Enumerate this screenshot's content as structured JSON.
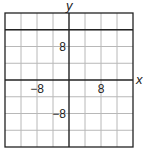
{
  "chart_data": {
    "type": "line",
    "title": "",
    "xlabel": "x",
    "ylabel": "y",
    "xlim": [
      -16,
      16
    ],
    "ylim": [
      -16,
      16
    ],
    "grid": true,
    "grid_step": 4,
    "x_tick_labels": [
      {
        "value": -8,
        "label": "−8"
      },
      {
        "value": 8,
        "label": "8"
      }
    ],
    "y_tick_labels": [
      {
        "value": 8,
        "label": "8"
      },
      {
        "value": -8,
        "label": "−8"
      }
    ],
    "series": [
      {
        "name": "horizontal line",
        "kind": "horizontal",
        "y": 12
      }
    ]
  }
}
